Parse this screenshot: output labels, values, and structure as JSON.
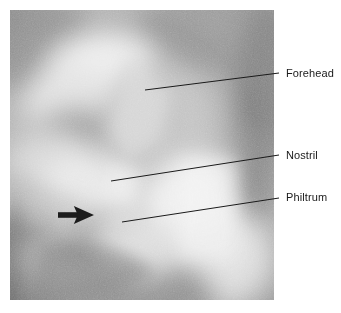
{
  "figure": {
    "type": "annotated-ultrasound-photograph",
    "modality": "ultrasound",
    "background_color": "#ffffff",
    "image_panel": {
      "name": "ultrasound-image",
      "x": 10,
      "y": 10,
      "width": 264,
      "height": 290,
      "tone_range": [
        "#4a4a4a",
        "#f2f2f2"
      ],
      "description": "Grayscale fetal face ultrasound, oblique profile view"
    }
  },
  "annotations": [
    {
      "id": "forehead",
      "label": "Forehead",
      "label_x": 286,
      "label_y": 67,
      "leader_line": {
        "x1": 145,
        "y1": 90,
        "x2": 279,
        "y2": 73
      },
      "color": "#1a1a1a"
    },
    {
      "id": "nostril",
      "label": "Nostril",
      "label_x": 286,
      "label_y": 149,
      "leader_line": {
        "x1": 111,
        "y1": 181,
        "x2": 279,
        "y2": 155
      },
      "color": "#1a1a1a"
    },
    {
      "id": "philtrum",
      "label": "Philtrum",
      "label_x": 286,
      "label_y": 191,
      "leader_line": {
        "x1": 122,
        "y1": 222,
        "x2": 279,
        "y2": 198
      },
      "color": "#1a1a1a"
    }
  ],
  "markers": [
    {
      "id": "arrow-marker",
      "shape": "solid-right-arrow",
      "color": "#1c1c1c",
      "x": 58,
      "y": 206,
      "width": 36,
      "height": 18,
      "points_to": "chin-lip-region"
    }
  ],
  "us_regions": [
    {
      "name": "forehead-bright-band",
      "tone": "#ededed",
      "cx": 95,
      "cy": 70,
      "rx": 62,
      "ry": 48
    },
    {
      "name": "upper-left-dark-shadow",
      "tone": "#8f8f8f",
      "cx": 30,
      "cy": 40,
      "rx": 55,
      "ry": 45
    },
    {
      "name": "eye-orbit-dark-region",
      "tone": "#9a9a9a",
      "cx": 70,
      "cy": 128,
      "rx": 52,
      "ry": 34
    },
    {
      "name": "nose-bright-region",
      "tone": "#e8e8e8",
      "cx": 80,
      "cy": 170,
      "rx": 52,
      "ry": 30
    },
    {
      "name": "cheek-bright-mass",
      "tone": "#f0f0f0",
      "cx": 185,
      "cy": 205,
      "rx": 60,
      "ry": 62
    },
    {
      "name": "right-edge-dark-band",
      "tone": "#7c7c7c",
      "cx": 252,
      "cy": 90,
      "rx": 26,
      "ry": 85
    },
    {
      "name": "lower-left-amniotic-fluid",
      "tone": "#6e6e6e",
      "cx": 18,
      "cy": 262,
      "rx": 72,
      "ry": 60
    },
    {
      "name": "lower-dark-shadow",
      "tone": "#8a8a8a",
      "cx": 120,
      "cy": 285,
      "rx": 95,
      "ry": 45
    },
    {
      "name": "top-right-dark-area",
      "tone": "#949494",
      "cx": 205,
      "cy": 25,
      "rx": 70,
      "ry": 42
    }
  ]
}
